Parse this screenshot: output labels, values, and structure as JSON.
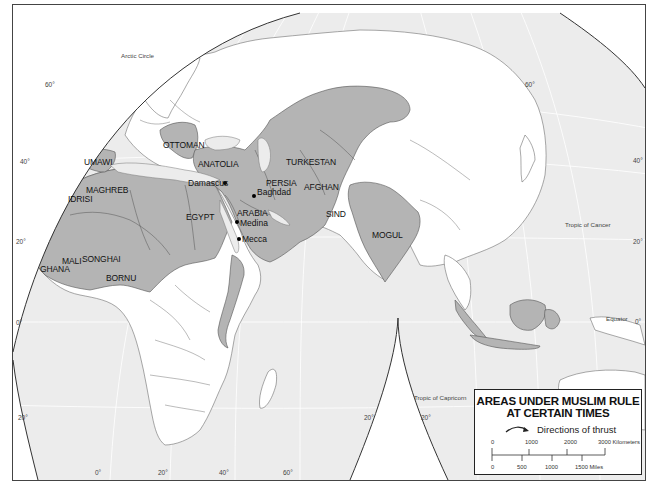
{
  "title": "Areas Under Muslim Rule at Certain Times",
  "legend": {
    "title_line1": "AREAS UNDER MUSLIM RULE",
    "title_line2": "AT CERTAIN TIMES",
    "thrust_label": "Directions of thrust",
    "thrust_icon": "curved-arrow-icon",
    "scale": {
      "km_ticks": [
        "0",
        "1000",
        "2000",
        "3000 Kilometers"
      ],
      "mile_ticks": [
        "0",
        "500",
        "1000",
        "1500 Miles"
      ]
    }
  },
  "colors": {
    "water": "#ececec",
    "land": "#ffffff",
    "muslim_rule": "#b4b4b4",
    "border": "#6f6f6f"
  },
  "regions": {
    "ottoman": "OTTOMAN",
    "umawi": "UMAWI",
    "anatolia": "ANATOLIA",
    "turkestan": "TURKESTAN",
    "maghreb": "MAGHREB",
    "idrisi": "IDRISI",
    "persia": "PERSIA",
    "afghan": "AFGHAN",
    "egypt": "EGYPT",
    "arabia": "ARABIA",
    "sind": "SIND",
    "mogul": "MOGUL",
    "mali": "MALI",
    "songhai": "SONGHAI",
    "ghana": "GHANA",
    "bornu": "BORNU"
  },
  "cities": {
    "damascus": "Damascus",
    "baghdad": "Baghdad",
    "medina": "Medina",
    "mecca": "Mecca"
  },
  "reference_lines": {
    "arctic_circle": "Arctic Circle",
    "tropic_of_cancer": "Tropic of Cancer",
    "tropic_of_capricorn": "Tropic of Capricorn",
    "equator": "Equator"
  },
  "grid_labels": {
    "left": [
      "60°",
      "40°",
      "20°",
      "0°",
      "20°"
    ],
    "right": [
      "60°",
      "40°",
      "20°",
      "0°"
    ],
    "bottom": [
      "0°",
      "20°",
      "40°",
      "60°"
    ],
    "center": [
      "20°",
      "20°"
    ]
  }
}
